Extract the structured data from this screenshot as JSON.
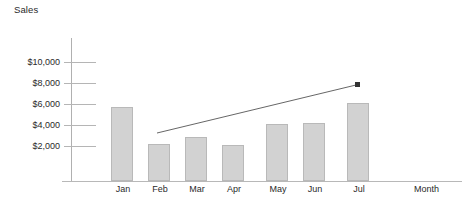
{
  "chart_data": {
    "type": "bar",
    "title": "Sales",
    "xlabel": "Month",
    "ylabel": "Sales",
    "categories": [
      "Jan",
      "Feb",
      "Mar",
      "Apr",
      "May",
      "Jun",
      "Jul"
    ],
    "values": [
      6400,
      3550,
      4200,
      3500,
      5000,
      5100,
      6700
    ],
    "ylim": [
      0,
      11000
    ],
    "yticks": [
      2000,
      4000,
      6000,
      8000,
      10000
    ],
    "ytick_labels": [
      "$2,000",
      "$4,000",
      "$6,000",
      "$8,000",
      "$10,000"
    ],
    "grid": true,
    "legend": false,
    "annotations": [
      {
        "name": "trend-arrow",
        "type": "arrow",
        "label": "",
        "from": {
          "x": 157,
          "y": 133
        },
        "to": {
          "x": 358,
          "y": 85
        }
      }
    ],
    "colors": {
      "bar_fill": "#d2d2d2",
      "bar_border": "#b9b9b9",
      "axis": "#b0b0b0",
      "grid": "#b5b5b5",
      "text": "#2a2a2a",
      "trend": "#555555"
    }
  },
  "axis": {
    "y_title": "Sales",
    "x_title": "Month"
  },
  "y_ticks": [
    {
      "label": "$10,000",
      "top": 57,
      "line_top": 62
    },
    {
      "label": "$8,000",
      "top": 78,
      "line_top": 83
    },
    {
      "label": "$6,000",
      "top": 99,
      "line_top": 104
    },
    {
      "label": "$4,000",
      "top": 120,
      "line_top": 125
    },
    {
      "label": "$2,000",
      "top": 141,
      "line_top": 146
    }
  ],
  "bars": [
    {
      "label": "Jan",
      "value": 6400,
      "left": 111,
      "top": 107,
      "height": 74,
      "label_left": 103
    },
    {
      "label": "Feb",
      "value": 3550,
      "left": 148,
      "top": 144,
      "height": 37,
      "label_left": 140
    },
    {
      "label": "Mar",
      "value": 4200,
      "left": 185,
      "top": 137,
      "height": 44,
      "label_left": 177
    },
    {
      "label": "Apr",
      "value": 3500,
      "left": 222,
      "top": 145,
      "height": 36,
      "label_left": 214
    },
    {
      "label": "May",
      "value": 5000,
      "left": 266,
      "top": 124,
      "height": 57,
      "label_left": 258
    },
    {
      "label": "Jun",
      "value": 5100,
      "left": 303,
      "top": 123,
      "height": 58,
      "label_left": 295
    },
    {
      "label": "Jul",
      "value": 6700,
      "left": 347,
      "top": 103,
      "height": 78,
      "label_left": 339
    }
  ]
}
